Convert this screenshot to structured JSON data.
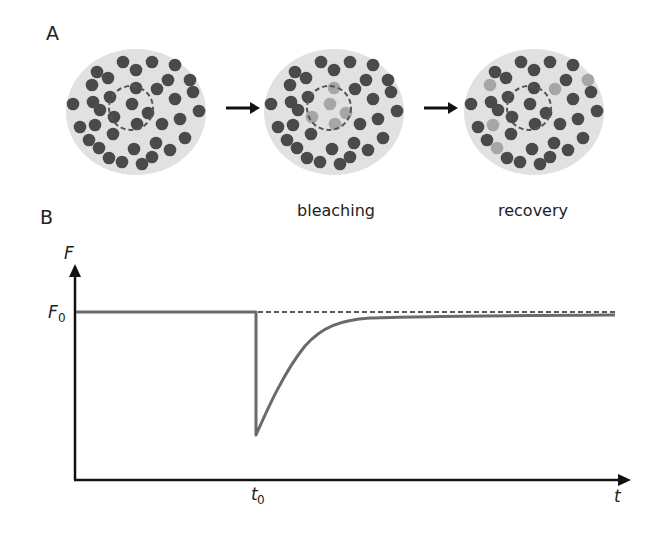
{
  "panel_a": {
    "label": "A",
    "stages": [
      {
        "id": "before",
        "caption": ""
      },
      {
        "id": "bleaching",
        "caption": "bleaching"
      },
      {
        "id": "recovery",
        "caption": "recovery"
      }
    ],
    "arrow_icon": "right-arrow-icon"
  },
  "panel_b": {
    "label": "B",
    "y_axis_label": "F",
    "y_ref_label": "F",
    "y_ref_sub": "0",
    "x_axis_label": "t",
    "x_ref_label": "t",
    "x_ref_sub": "0"
  },
  "colors": {
    "cell_fill": "#e4e4e4",
    "molecule_fluorescent": "#4a4a4a",
    "molecule_bleached": "#a6a6a6",
    "curve": "#6a6a6a",
    "axis": "#111111"
  },
  "chart_data": {
    "type": "line",
    "xlabel": "t",
    "ylabel": "F",
    "x_ticks": [
      "t0"
    ],
    "y_ticks": [
      "F0"
    ],
    "series": [
      {
        "name": "fluorescence",
        "style": "solid",
        "description": "constant at F0 until t0, instant drop to minimum, exponential recovery approaching slightly below F0"
      },
      {
        "name": "F0 reference",
        "style": "dashed",
        "description": "horizontal line at F0 from t0 onward"
      }
    ],
    "x": [
      0,
      1,
      1,
      1.3,
      1.6,
      2.0,
      2.5,
      3.0,
      4.0,
      5.0
    ],
    "values": [
      1.0,
      1.0,
      0.3,
      0.62,
      0.82,
      0.93,
      0.96,
      0.97,
      0.975,
      0.978
    ],
    "grid": false
  }
}
